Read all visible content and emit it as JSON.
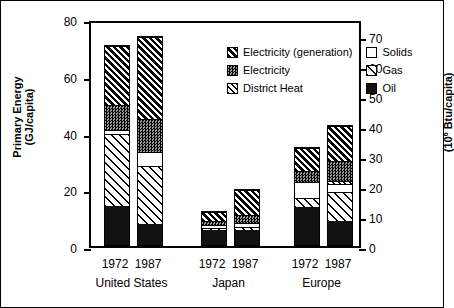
{
  "chart_data": {
    "type": "bar",
    "title": "",
    "subtitle": "",
    "stacked": true,
    "grid": false,
    "legend_position": "inside-top-center",
    "ylabel": "Primary Energy",
    "ylabel_units": "(GJ/capita)",
    "y2label_prefix": "(10",
    "y2label_exp": "6",
    "y2label_suffix": " Btu/capita)",
    "ylim": [
      0,
      80
    ],
    "yticks": [
      0,
      20,
      40,
      60,
      80
    ],
    "yticklabels": [
      "0",
      "20",
      "40",
      "60",
      "80"
    ],
    "y2lim": [
      0,
      75.8
    ],
    "y2ticks": [
      0,
      10,
      20,
      30,
      40,
      50,
      60,
      70
    ],
    "y2ticklabels": [
      "0",
      "10",
      "20",
      "30",
      "40",
      "50",
      "60",
      "70"
    ],
    "xlabel": "",
    "groups": [
      "United States",
      "Japan",
      "Europe"
    ],
    "categories": [
      "1972",
      "1987",
      "1972",
      "1987",
      "1972",
      "1987"
    ],
    "series": [
      {
        "name": "Oil",
        "key": "oil",
        "values": [
          14.0,
          7.5,
          5.5,
          5.5,
          13.5,
          8.5
        ]
      },
      {
        "name": "Gas",
        "key": "gas",
        "values": [
          25.5,
          20.5,
          1.0,
          1.0,
          3.5,
          10.5
        ]
      },
      {
        "name": "Solids",
        "key": "solids",
        "values": [
          1.5,
          5.0,
          1.0,
          1.5,
          5.5,
          3.0
        ]
      },
      {
        "name": "District Heat",
        "key": "dheat",
        "values": [
          0.0,
          0.0,
          0.0,
          0.0,
          0.0,
          1.0
        ]
      },
      {
        "name": "Electricity",
        "key": "elec",
        "values": [
          9.0,
          12.0,
          1.5,
          3.0,
          4.0,
          7.0
        ]
      },
      {
        "name": "Electricity (generation)",
        "key": "gen",
        "values": [
          21.0,
          29.0,
          3.5,
          9.0,
          8.5,
          12.5
        ]
      }
    ],
    "totals": [
      71.0,
      74.0,
      12.5,
      20.0,
      35.0,
      42.5
    ]
  },
  "legend": {
    "left_column": [
      {
        "label": "Electricity (generation)",
        "pattern": "gen"
      },
      {
        "label": "Electricity",
        "pattern": "elec"
      },
      {
        "label": "District Heat",
        "pattern": "dheat"
      }
    ],
    "right_column": [
      {
        "label": "Solids",
        "pattern": "solids"
      },
      {
        "label": "Gas",
        "pattern": "gas"
      },
      {
        "label": "Oil",
        "pattern": "oil"
      }
    ]
  },
  "colors": {
    "ink": "#000000",
    "paper": "#ffffff",
    "electricity_gray": "#9a9a9a"
  }
}
